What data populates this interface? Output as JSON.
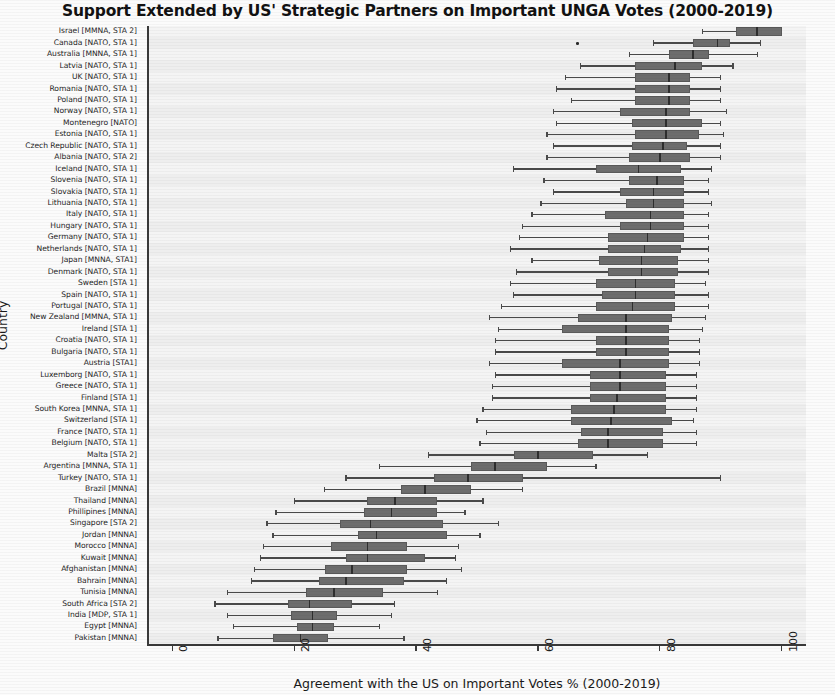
{
  "chart_data": {
    "type": "box",
    "title": "Support Extended by US' Strategic Partners on Important UNGA Votes (2000-2019)",
    "xlabel": "Agreement with the US on Important Votes % (2000-2019)",
    "ylabel": "Country",
    "xlim": [
      -4,
      104
    ],
    "xticks": [
      0,
      20,
      40,
      60,
      80,
      100
    ],
    "xticklabels": [
      "0",
      "20",
      "40",
      "60",
      "80",
      "100"
    ],
    "orientation": "horizontal",
    "grid": false,
    "legend": null,
    "box_fill": "#6d6d6d",
    "box_edge": "#5a5a5a",
    "median_color": "#2e2e2e",
    "whisker_color": "#4a4a4a",
    "plot_background": "#f2f2f2",
    "categories": [
      "Israel [MMNA, STA 2]",
      "Canada [NATO, STA 1]",
      "Australia [MNNA, STA 1]",
      "Latvia [NATO, STA 1]",
      "UK [NATO, STA 1]",
      "Romania [NATO, STA 1]",
      "Poland [NATO, STA 1]",
      "Norway [NATO, STA 1]",
      "Montenegro [NATO]",
      "Estonia [NATO, STA 1]",
      "Czech Republic [NATO, STA 1]",
      "Albania [NATO, STA 2]",
      "Iceland [NATO, STA 1]",
      "Slovenia [NATO, STA 1]",
      "Slovakia [NATO, STA 1]",
      "Lithuania [NATO, STA 1]",
      "Italy [NATO, STA 1]",
      "Hungary [NATO, STA 1]",
      "Germany [NATO, STA 1]",
      "Netherlands [NATO, STA 1]",
      "Japan [MNNA, STA1]",
      "Denmark [NATO, STA 1]",
      "Sweden [STA 1]",
      "Spain [NATO, STA 1]",
      "Portugal [NATO, STA 1]",
      "New Zealand [MMNA, STA 1]",
      "Ireland [STA 1]",
      "Croatia [NATO, STA 1]",
      "Bulgaria [NATO, STA 1]",
      "Austria [STA1]",
      "Luxemborg [NATO, STA 1]",
      "Greece [NATO, STA 1]",
      "Finland [STA 1]",
      "South Korea [MNNA, STA 1]",
      "Switzerland [STA 1]",
      "France [NATO, STA 1]",
      "Belgium [NATO, STA 1]",
      "Malta [STA 2]",
      "Argentina [MNNA, STA 1]",
      "Turkey [NATO, STA 1]",
      "Brazil [MNNA]",
      "Thailand [MNNA]",
      "Phillipines [MNNA]",
      "Singapore [STA 2]",
      "Jordan [MNNA]",
      "Morocco [MNNA]",
      "Kuwait [MNNA]",
      "Afghanistan [MNNA]",
      "Bahrain [MNNA]",
      "Tunisia [MNNA]",
      "South Africa [STA 2]",
      "India [MDP, STA 1]",
      "Egypt [MNNA]",
      "Pakistan [MNNA]"
    ],
    "boxes": [
      {
        "country": "Israel [MMNA, STA 2]",
        "whisker_low": 87.0,
        "q1": 92.5,
        "median": 96.0,
        "q3": 100.0,
        "whisker_high": 100.0,
        "fliers": []
      },
      {
        "country": "Canada [NATO, STA 1]",
        "whisker_low": 79.0,
        "q1": 85.5,
        "median": 89.5,
        "q3": 91.5,
        "whisker_high": 96.5,
        "fliers": [
          66.5
        ]
      },
      {
        "country": "Australia [MNNA, STA 1]",
        "whisker_low": 75.0,
        "q1": 81.5,
        "median": 85.5,
        "q3": 88.0,
        "whisker_high": 96.0,
        "fliers": []
      },
      {
        "country": "Latvia [NATO, STA 1]",
        "whisker_low": 67.0,
        "q1": 76.0,
        "median": 82.5,
        "q3": 87.0,
        "whisker_high": 92.0,
        "fliers": []
      },
      {
        "country": "UK [NATO, STA 1]",
        "whisker_low": 64.5,
        "q1": 76.0,
        "median": 81.5,
        "q3": 85.0,
        "whisker_high": 90.0,
        "fliers": []
      },
      {
        "country": "Romania [NATO, STA 1]",
        "whisker_low": 63.0,
        "q1": 76.0,
        "median": 81.5,
        "q3": 85.0,
        "whisker_high": 90.0,
        "fliers": []
      },
      {
        "country": "Poland [NATO, STA 1]",
        "whisker_low": 65.5,
        "q1": 76.0,
        "median": 81.5,
        "q3": 85.0,
        "whisker_high": 90.0,
        "fliers": []
      },
      {
        "country": "Norway [NATO, STA 1]",
        "whisker_low": 62.5,
        "q1": 73.5,
        "median": 81.0,
        "q3": 85.0,
        "whisker_high": 91.0,
        "fliers": []
      },
      {
        "country": "Montenegro [NATO]",
        "whisker_low": 63.0,
        "q1": 75.5,
        "median": 81.0,
        "q3": 87.0,
        "whisker_high": 90.0,
        "fliers": []
      },
      {
        "country": "Estonia [NATO, STA 1]",
        "whisker_low": 61.5,
        "q1": 76.0,
        "median": 81.0,
        "q3": 86.5,
        "whisker_high": 90.5,
        "fliers": []
      },
      {
        "country": "Czech Republic [NATO, STA 1]",
        "whisker_low": 62.5,
        "q1": 75.5,
        "median": 80.5,
        "q3": 84.5,
        "whisker_high": 90.0,
        "fliers": []
      },
      {
        "country": "Albania [NATO, STA 2]",
        "whisker_low": 61.5,
        "q1": 75.0,
        "median": 80.0,
        "q3": 85.0,
        "whisker_high": 90.0,
        "fliers": []
      },
      {
        "country": "Iceland [NATO, STA 1]",
        "whisker_low": 56.0,
        "q1": 69.5,
        "median": 76.5,
        "q3": 83.5,
        "whisker_high": 88.5,
        "fliers": []
      },
      {
        "country": "Slovenia [NATO, STA 1]",
        "whisker_low": 61.0,
        "q1": 75.0,
        "median": 79.5,
        "q3": 84.0,
        "whisker_high": 88.0,
        "fliers": []
      },
      {
        "country": "Slovakia [NATO, STA 1]",
        "whisker_low": 62.5,
        "q1": 73.5,
        "median": 79.0,
        "q3": 84.0,
        "whisker_high": 88.0,
        "fliers": []
      },
      {
        "country": "Lithuania [NATO, STA 1]",
        "whisker_low": 60.5,
        "q1": 74.5,
        "median": 79.0,
        "q3": 84.0,
        "whisker_high": 88.5,
        "fliers": []
      },
      {
        "country": "Italy [NATO, STA 1]",
        "whisker_low": 59.0,
        "q1": 71.0,
        "median": 78.5,
        "q3": 84.0,
        "whisker_high": 88.0,
        "fliers": []
      },
      {
        "country": "Hungary [NATO, STA 1]",
        "whisker_low": 57.5,
        "q1": 73.5,
        "median": 78.5,
        "q3": 84.0,
        "whisker_high": 88.0,
        "fliers": []
      },
      {
        "country": "Germany [NATO, STA 1]",
        "whisker_low": 57.0,
        "q1": 71.5,
        "median": 78.0,
        "q3": 84.0,
        "whisker_high": 88.0,
        "fliers": []
      },
      {
        "country": "Netherlands [NATO, STA 1]",
        "whisker_low": 55.5,
        "q1": 71.5,
        "median": 77.5,
        "q3": 83.5,
        "whisker_high": 88.0,
        "fliers": []
      },
      {
        "country": "Japan [MNNA, STA1]",
        "whisker_low": 59.0,
        "q1": 70.0,
        "median": 77.0,
        "q3": 83.0,
        "whisker_high": 88.0,
        "fliers": []
      },
      {
        "country": "Denmark [NATO, STA 1]",
        "whisker_low": 56.5,
        "q1": 71.5,
        "median": 77.0,
        "q3": 83.0,
        "whisker_high": 88.0,
        "fliers": []
      },
      {
        "country": "Sweden [STA 1]",
        "whisker_low": 55.5,
        "q1": 69.5,
        "median": 76.0,
        "q3": 82.5,
        "whisker_high": 87.5,
        "fliers": []
      },
      {
        "country": "Spain [NATO, STA 1]",
        "whisker_low": 56.0,
        "q1": 70.5,
        "median": 76.0,
        "q3": 82.5,
        "whisker_high": 88.0,
        "fliers": []
      },
      {
        "country": "Portugal [NATO, STA 1]",
        "whisker_low": 54.0,
        "q1": 69.5,
        "median": 75.5,
        "q3": 82.5,
        "whisker_high": 88.0,
        "fliers": []
      },
      {
        "country": "New Zealand [MMNA, STA 1]",
        "whisker_low": 52.0,
        "q1": 66.5,
        "median": 74.5,
        "q3": 82.0,
        "whisker_high": 87.5,
        "fliers": []
      },
      {
        "country": "Ireland [STA 1]",
        "whisker_low": 53.5,
        "q1": 64.0,
        "median": 74.5,
        "q3": 81.5,
        "whisker_high": 87.0,
        "fliers": []
      },
      {
        "country": "Croatia [NATO, STA 1]",
        "whisker_low": 53.0,
        "q1": 69.5,
        "median": 74.5,
        "q3": 81.5,
        "whisker_high": 86.5,
        "fliers": []
      },
      {
        "country": "Bulgaria [NATO, STA 1]",
        "whisker_low": 53.0,
        "q1": 69.5,
        "median": 74.5,
        "q3": 81.5,
        "whisker_high": 86.5,
        "fliers": []
      },
      {
        "country": "Austria [STA1]",
        "whisker_low": 52.0,
        "q1": 64.0,
        "median": 73.5,
        "q3": 81.5,
        "whisker_high": 86.5,
        "fliers": []
      },
      {
        "country": "Luxemborg [NATO, STA 1]",
        "whisker_low": 53.0,
        "q1": 68.5,
        "median": 73.5,
        "q3": 81.0,
        "whisker_high": 86.0,
        "fliers": []
      },
      {
        "country": "Greece [NATO, STA 1]",
        "whisker_low": 52.5,
        "q1": 68.5,
        "median": 73.5,
        "q3": 81.0,
        "whisker_high": 86.0,
        "fliers": []
      },
      {
        "country": "Finland [STA 1]",
        "whisker_low": 52.5,
        "q1": 68.5,
        "median": 73.0,
        "q3": 81.0,
        "whisker_high": 86.0,
        "fliers": []
      },
      {
        "country": "South Korea [MNNA, STA 1]",
        "whisker_low": 51.0,
        "q1": 65.5,
        "median": 72.5,
        "q3": 81.0,
        "whisker_high": 86.0,
        "fliers": []
      },
      {
        "country": "Switzerland [STA 1]",
        "whisker_low": 50.0,
        "q1": 65.5,
        "median": 72.0,
        "q3": 82.0,
        "whisker_high": 85.5,
        "fliers": []
      },
      {
        "country": "France [NATO, STA 1]",
        "whisker_low": 51.5,
        "q1": 67.0,
        "median": 71.5,
        "q3": 80.5,
        "whisker_high": 86.0,
        "fliers": []
      },
      {
        "country": "Belgium [NATO, STA 1]",
        "whisker_low": 50.5,
        "q1": 66.5,
        "median": 71.5,
        "q3": 80.5,
        "whisker_high": 86.0,
        "fliers": []
      },
      {
        "country": "Malta [STA 2]",
        "whisker_low": 42.0,
        "q1": 56.0,
        "median": 60.0,
        "q3": 69.0,
        "whisker_high": 78.0,
        "fliers": []
      },
      {
        "country": "Argentina [MNNA, STA 1]",
        "whisker_low": 34.0,
        "q1": 49.0,
        "median": 53.0,
        "q3": 61.5,
        "whisker_high": 69.5,
        "fliers": []
      },
      {
        "country": "Turkey [NATO, STA 1]",
        "whisker_low": 28.5,
        "q1": 43.0,
        "median": 48.5,
        "q3": 57.5,
        "whisker_high": 90.0,
        "fliers": []
      },
      {
        "country": "Brazil [MNNA]",
        "whisker_low": 25.0,
        "q1": 37.5,
        "median": 41.5,
        "q3": 49.0,
        "whisker_high": 57.5,
        "fliers": []
      },
      {
        "country": "Thailand [MNNA]",
        "whisker_low": 20.0,
        "q1": 32.0,
        "median": 36.5,
        "q3": 43.5,
        "whisker_high": 51.0,
        "fliers": []
      },
      {
        "country": "Phillipines [MNNA]",
        "whisker_low": 17.0,
        "q1": 31.5,
        "median": 36.0,
        "q3": 43.5,
        "whisker_high": 48.0,
        "fliers": []
      },
      {
        "country": "Singapore [STA 2]",
        "whisker_low": 15.5,
        "q1": 27.5,
        "median": 32.5,
        "q3": 44.5,
        "whisker_high": 53.5,
        "fliers": []
      },
      {
        "country": "Jordan [MNNA]",
        "whisker_low": 16.5,
        "q1": 30.5,
        "median": 33.5,
        "q3": 45.0,
        "whisker_high": 50.5,
        "fliers": []
      },
      {
        "country": "Morocco [MNNA]",
        "whisker_low": 15.0,
        "q1": 26.0,
        "median": 32.0,
        "q3": 38.5,
        "whisker_high": 47.0,
        "fliers": []
      },
      {
        "country": "Kuwait [MNNA]",
        "whisker_low": 14.5,
        "q1": 28.5,
        "median": 32.0,
        "q3": 41.5,
        "whisker_high": 46.5,
        "fliers": []
      },
      {
        "country": "Afghanistan [MNNA]",
        "whisker_low": 13.5,
        "q1": 25.0,
        "median": 29.5,
        "q3": 38.5,
        "whisker_high": 47.5,
        "fliers": []
      },
      {
        "country": "Bahrain [MNNA]",
        "whisker_low": 13.0,
        "q1": 24.0,
        "median": 28.5,
        "q3": 38.0,
        "whisker_high": 45.0,
        "fliers": []
      },
      {
        "country": "Tunisia [MNNA]",
        "whisker_low": 9.0,
        "q1": 22.0,
        "median": 26.5,
        "q3": 34.5,
        "whisker_high": 43.5,
        "fliers": []
      },
      {
        "country": "South Africa [STA 2]",
        "whisker_low": 7.0,
        "q1": 19.0,
        "median": 22.5,
        "q3": 29.5,
        "whisker_high": 36.5,
        "fliers": []
      },
      {
        "country": "India [MDP, STA 1]",
        "whisker_low": 9.0,
        "q1": 19.5,
        "median": 23.0,
        "q3": 27.0,
        "whisker_high": 36.0,
        "fliers": []
      },
      {
        "country": "Egypt [MNNA]",
        "whisker_low": 10.0,
        "q1": 20.5,
        "median": 23.0,
        "q3": 26.5,
        "whisker_high": 34.0,
        "fliers": []
      },
      {
        "country": "Pakistan [MNNA]",
        "whisker_low": 7.5,
        "q1": 16.5,
        "median": 21.0,
        "q3": 25.5,
        "whisker_high": 38.0,
        "fliers": []
      }
    ]
  }
}
